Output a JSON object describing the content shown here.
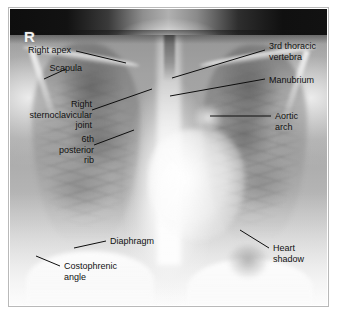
{
  "figure": {
    "kind": "annotated-radiograph",
    "modality": "chest x-ray",
    "view": "posteroanterior",
    "side_marker": "R",
    "film_stamp": "",
    "border_color": "#b9b9b9",
    "page_background": "#ffffff",
    "label_color": "#111111",
    "leader_color": "#0d0d0d"
  },
  "annotations": [
    {
      "id": "right-apex",
      "text": "Right apex",
      "align": "right"
    },
    {
      "id": "scapula",
      "text": "Scapula",
      "align": "right"
    },
    {
      "id": "right-sternoclavicular-joint",
      "text": "Right\nsternoclavicular\njoint",
      "align": "right"
    },
    {
      "id": "sixth-posterior-rib",
      "text": "6th\nposterior\nrib",
      "align": "right"
    },
    {
      "id": "third-thoracic-vertebra",
      "text": "3rd thoracic\nvertebra",
      "align": "left"
    },
    {
      "id": "manubrium",
      "text": "Manubrium",
      "align": "left"
    },
    {
      "id": "aortic-arch",
      "text": "Aortic\narch",
      "align": "left"
    },
    {
      "id": "diaphragm",
      "text": "Diaphragm",
      "align": "left"
    },
    {
      "id": "costophrenic-angle",
      "text": "Costophrenic\nangle",
      "align": "left"
    },
    {
      "id": "heart-shadow",
      "text": "Heart\nshadow",
      "align": "left"
    }
  ]
}
